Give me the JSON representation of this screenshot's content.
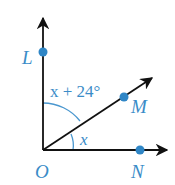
{
  "diagram": {
    "type": "angle-diagram",
    "colors": {
      "ray": "#111111",
      "point": "#2f86c6",
      "label": "#3a8cc8",
      "arc": "#4a97cf"
    },
    "vertex": {
      "label": "O"
    },
    "points": [
      {
        "label": "L",
        "ray": "vertical"
      },
      {
        "label": "M",
        "ray": "diagonal"
      },
      {
        "label": "N",
        "ray": "horizontal"
      }
    ],
    "angles": [
      {
        "name": "angle-LOM",
        "label": "x + 24°"
      },
      {
        "name": "angle-MON",
        "label": "x"
      }
    ]
  }
}
